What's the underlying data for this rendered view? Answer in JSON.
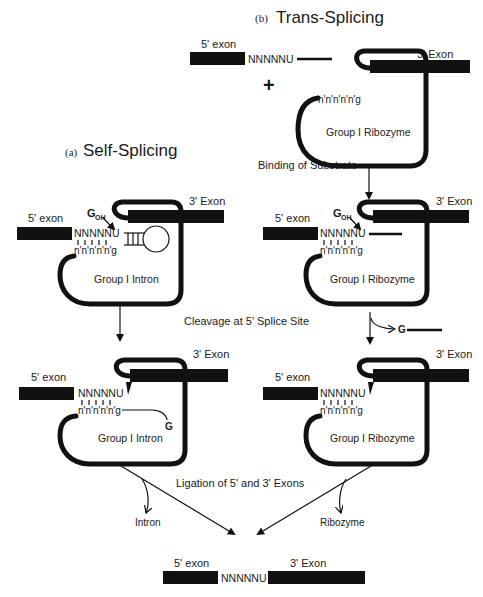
{
  "titles": {
    "trans": {
      "prefix": "(b)",
      "label": "Trans-Splicing"
    },
    "self": {
      "prefix": "(a)",
      "label": "Self-Splicing"
    }
  },
  "labels": {
    "exon5": "5' exon",
    "exon3": "3' Exon",
    "substrate_seq": "NNNNNU",
    "seq_top": "NNNNN",
    "seq_u": "U",
    "guide_seq": "n'n'n'n'n'g",
    "plus": "+",
    "g_oh": "G",
    "g_oh_sub": "OH",
    "g": "G",
    "group_intron": "Group I Intron",
    "group_ribozyme": "Group I Ribozyme",
    "intron": "Intron",
    "ribozyme": "Ribozyme"
  },
  "steps": {
    "binding": "Binding of Substrate",
    "cleavage": "Cleavage at 5' Splice Site",
    "ligation": "Ligation of 5' and 3' Exons"
  },
  "colors": {
    "ink": "#111111",
    "background": "#ffffff"
  }
}
